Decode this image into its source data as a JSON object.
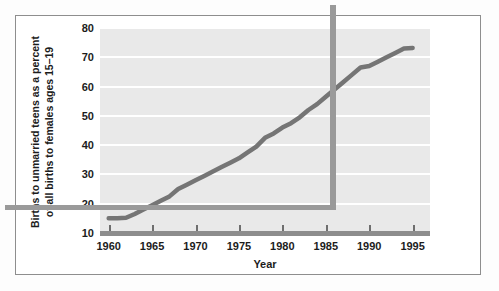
{
  "chart_data": {
    "type": "line",
    "title": "",
    "xlabel": "Year",
    "ylabel": "Births to unmarried teens as a percent\nof all births to females ages 15–19",
    "ylabel_line1": "Births to unmarried teens as a percent",
    "ylabel_line2": "of all births to females ages 15–19",
    "xlim": [
      1959,
      1997
    ],
    "ylim": [
      10,
      80
    ],
    "yticks": [
      10,
      20,
      30,
      40,
      50,
      60,
      70,
      80
    ],
    "ytick_labels": [
      "10",
      "20",
      "30",
      "40",
      "50",
      "60",
      "70",
      "80"
    ],
    "xticks": [
      1960,
      1965,
      1970,
      1975,
      1980,
      1985,
      1990,
      1995
    ],
    "xtick_labels": [
      "1960",
      "1965",
      "1970",
      "1975",
      "1980",
      "1985",
      "1990",
      "1995"
    ],
    "grid": "horizontal",
    "legend": "none",
    "series": [
      {
        "name": "Births to unmarried teens as a percent of all births to females ages 15-19",
        "color": "#757575",
        "x": [
          1960,
          1961,
          1962,
          1963,
          1964,
          1965,
          1966,
          1967,
          1968,
          1969,
          1970,
          1971,
          1972,
          1973,
          1974,
          1975,
          1976,
          1977,
          1978,
          1979,
          1980,
          1981,
          1982,
          1983,
          1984,
          1985,
          1986,
          1987,
          1988,
          1989,
          1990,
          1991,
          1992,
          1993,
          1994,
          1995
        ],
        "values": [
          15.0,
          15.0,
          15.2,
          16.5,
          18.0,
          19.5,
          21.0,
          22.5,
          25.0,
          26.5,
          28.0,
          29.5,
          31.0,
          32.5,
          34.0,
          35.5,
          37.5,
          39.5,
          42.5,
          44.0,
          46.0,
          47.5,
          49.5,
          52.0,
          54.0,
          56.5,
          59.0,
          61.5,
          64.0,
          66.5,
          67.0,
          68.5,
          70.0,
          71.5,
          73.0,
          73.2
        ]
      }
    ]
  },
  "axes": {
    "y_label_line1": "Births to unmarried teens as a percent",
    "y_label_line2": "of all births to females ages 15–19",
    "x_label": "Year"
  },
  "colors": {
    "line": "#757575",
    "plot_background": "#e9e9e9",
    "gridline": "#ffffff",
    "shadow": "#9a9a9a",
    "axis_bar": "#8d8d8d",
    "frame_border": "#8e8e8e",
    "text": "#1c1c1c"
  }
}
